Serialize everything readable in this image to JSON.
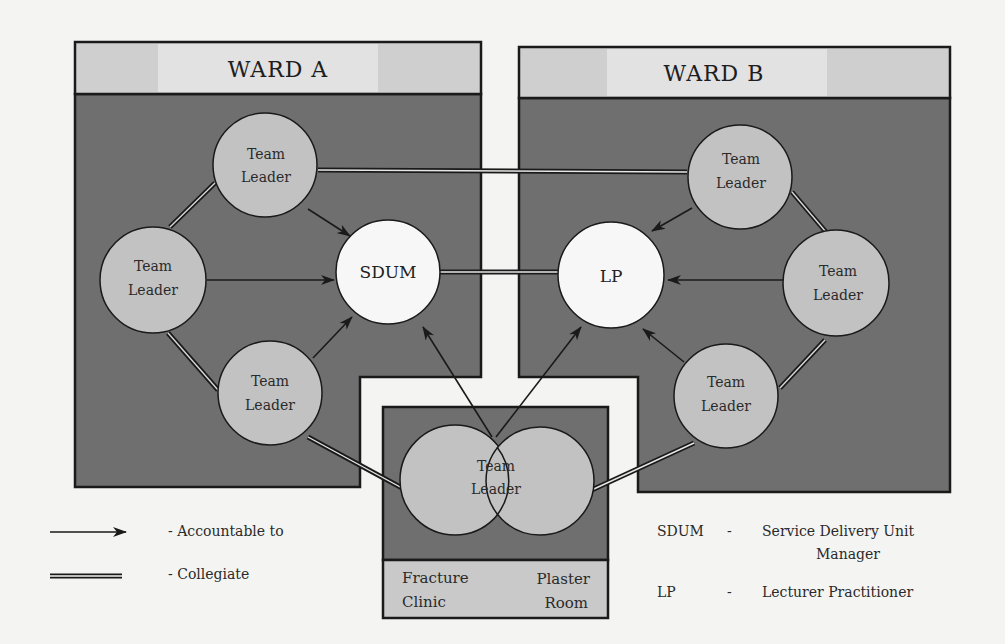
{
  "colors": {
    "page_bg": "#f4f4f2",
    "ward_body": "#6f6f6f",
    "ward_header": "#cfcfcf",
    "ward_header_highlight": "#e2e2e2",
    "team_leader_fill": "#c2c2c2",
    "manager_fill": "#f7f7f7",
    "outline": "#1a1a1a",
    "label_band": "#c9c9c9"
  },
  "ward_a": {
    "title": "WARD A",
    "team_leaders": [
      {
        "line1": "Team",
        "line2": "Leader"
      },
      {
        "line1": "Team",
        "line2": "Leader"
      },
      {
        "line1": "Team",
        "line2": "Leader"
      }
    ],
    "manager": {
      "label": "SDUM"
    }
  },
  "ward_b": {
    "title": "WARD B",
    "team_leaders": [
      {
        "line1": "Team",
        "line2": "Leader"
      },
      {
        "line1": "Team",
        "line2": "Leader"
      },
      {
        "line1": "Team",
        "line2": "Leader"
      }
    ],
    "manager": {
      "label": "LP"
    }
  },
  "shared_unit": {
    "team_leader": {
      "line1": "Team",
      "line2": "Leader"
    },
    "areas": [
      {
        "line1": "Fracture",
        "line2": "Clinic"
      },
      {
        "line1": "Plaster",
        "line2": "Room"
      }
    ]
  },
  "legend": {
    "line_types": [
      {
        "symbol": "arrow",
        "label": "- Accountable to"
      },
      {
        "symbol": "double-line",
        "label": "- Collegiate"
      }
    ],
    "abbreviations": [
      {
        "abbr": "SDUM",
        "dash": "-",
        "line1": "Service Delivery Unit",
        "line2": "Manager"
      },
      {
        "abbr": "LP",
        "dash": "-",
        "line1": "Lecturer Practitioner"
      }
    ]
  }
}
